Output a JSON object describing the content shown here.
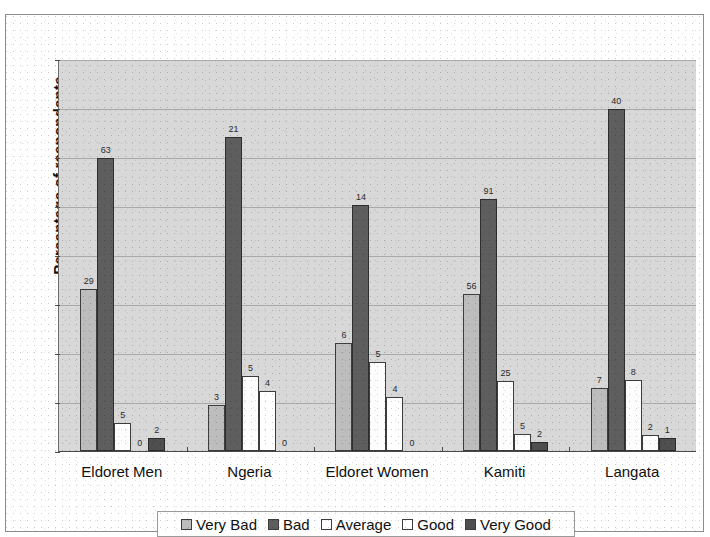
{
  "chart_data": {
    "type": "bar",
    "title": "",
    "xlabel": "",
    "ylabel": "Percentage of respondents",
    "ylim": [
      0,
      80
    ],
    "ytick_step": 10,
    "yticks": [
      "0",
      "10",
      "20",
      "30",
      "40",
      "50",
      "60",
      "70",
      "80"
    ],
    "grid": true,
    "legend_position": "bottom",
    "categories": [
      "Eldoret Men",
      "Ngeria",
      "Eldoret Women",
      "Kamiti",
      "Langata"
    ],
    "series": [
      {
        "name": "Very Bad",
        "color": "#bdbdbd",
        "values": [
          33,
          9.3,
          22,
          32,
          12.8
        ],
        "labels": [
          "29",
          "3",
          "6",
          "56",
          "7"
        ]
      },
      {
        "name": "Bad",
        "color": "#5e5e5e",
        "values": [
          59.8,
          64,
          50.2,
          51.4,
          69.8
        ],
        "labels": [
          "63",
          "21",
          "14",
          "91",
          "40"
        ]
      },
      {
        "name": "Average",
        "color": "#fdfdfd",
        "values": [
          5.8,
          15.3,
          18.2,
          14.2,
          14.4
        ],
        "labels": [
          "5",
          "5",
          "5",
          "25",
          "8"
        ]
      },
      {
        "name": "Good",
        "color": "#ffffff",
        "values": [
          0,
          12.3,
          11,
          3.4,
          3.2
        ],
        "labels": [
          "0",
          "4",
          "4",
          "5",
          "2"
        ]
      },
      {
        "name": "Very Good",
        "color": "#4f4f4f",
        "values": [
          2.7,
          0,
          0,
          1.8,
          2.7
        ],
        "labels": [
          "2",
          "0",
          "0",
          "2",
          "1"
        ]
      }
    ]
  },
  "axis": {
    "y_title": "Percentage of respondents"
  },
  "legend": {
    "items": [
      {
        "label": "Very Bad"
      },
      {
        "label": "Bad"
      },
      {
        "label": "Average"
      },
      {
        "label": "Good"
      },
      {
        "label": "Very Good"
      }
    ]
  }
}
